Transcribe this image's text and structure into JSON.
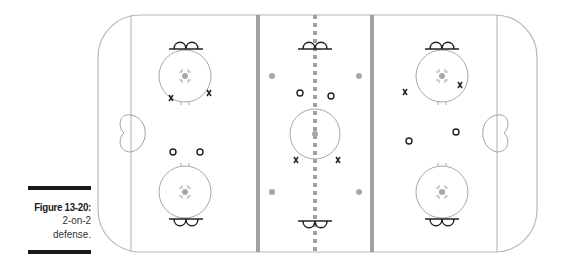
{
  "caption": {
    "figure_label": "Figure 13-20:",
    "line1": "2-on-2",
    "line2": "defense."
  },
  "diagram": {
    "type": "hockey-rink-drill",
    "title": "2-on-2 defense",
    "colors": {
      "boards": "#b8b8b8",
      "lines": "#9a9a9a",
      "blue_line": "#a0a0a0",
      "dot": "#a8a8a8",
      "player_mark": "#222222"
    },
    "legend": {
      "x": "defender",
      "o": "attacker"
    },
    "defenders_x": [
      {
        "x": 171,
        "y": 98
      },
      {
        "x": 209,
        "y": 93
      },
      {
        "x": 296,
        "y": 160
      },
      {
        "x": 338,
        "y": 160
      },
      {
        "x": 405,
        "y": 92
      },
      {
        "x": 460,
        "y": 85
      }
    ],
    "attackers_o": [
      {
        "x": 173,
        "y": 152
      },
      {
        "x": 200,
        "y": 152
      },
      {
        "x": 300,
        "y": 93
      },
      {
        "x": 331,
        "y": 96
      },
      {
        "x": 409,
        "y": 141
      },
      {
        "x": 456,
        "y": 132
      }
    ]
  }
}
